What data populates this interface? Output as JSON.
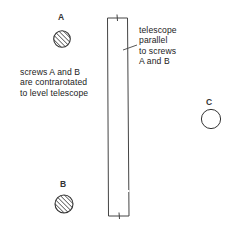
{
  "figure": {
    "screws": [
      {
        "id": "A",
        "label": "A",
        "style": "hatched"
      },
      {
        "id": "B",
        "label": "B",
        "style": "hatched"
      },
      {
        "id": "C",
        "label": "C",
        "style": "open"
      }
    ],
    "telescope_note": {
      "lines": [
        "telescope",
        "parallel",
        "to screws",
        "A and B"
      ]
    },
    "screws_note": {
      "lines": [
        "screws A and B",
        "are contrarotated",
        "to level telescope"
      ]
    },
    "colors": {
      "ink": "#333333",
      "background": "#ffffff"
    }
  }
}
